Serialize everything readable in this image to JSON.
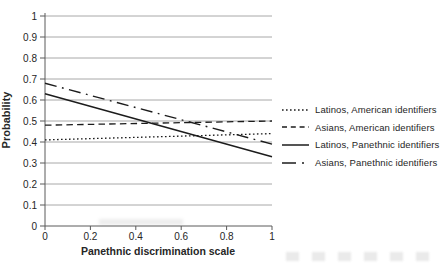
{
  "chart_data": {
    "type": "line",
    "title": "",
    "xlabel": "Panethnic discrimination scale",
    "ylabel": "Probability",
    "xlim": [
      0,
      1
    ],
    "ylim": [
      0,
      1
    ],
    "grid": "horizontal",
    "legend_position": "right",
    "x_ticks": [
      0,
      0.2,
      0.4,
      0.6,
      0.8,
      1
    ],
    "x_tick_labels": [
      "0",
      "0.2",
      "0.4",
      "0.6",
      "0.8",
      "1"
    ],
    "y_ticks": [
      0,
      0.1,
      0.2,
      0.3,
      0.4,
      0.5,
      0.6,
      0.7,
      0.8,
      0.9,
      1
    ],
    "y_tick_labels": [
      "0",
      "0.1",
      "0.2",
      "0.3",
      "0.4",
      "0.5",
      "0.6",
      "0.7",
      "0.8",
      "0.9",
      "1"
    ],
    "x": [
      0,
      1
    ],
    "series": [
      {
        "name": "Latinos, American identifiers",
        "style": "dotted",
        "values": [
          0.41,
          0.44
        ]
      },
      {
        "name": "Asians, American identifiers",
        "style": "dashed",
        "values": [
          0.48,
          0.5
        ]
      },
      {
        "name": "Latinos, Panethnic identifiers",
        "style": "solid",
        "values": [
          0.63,
          0.33
        ]
      },
      {
        "name": "Asians, Panethnic identifiers",
        "style": "dashdot",
        "values": [
          0.68,
          0.39
        ]
      }
    ],
    "colors": {
      "line": "#1c1c1c",
      "grid": "#a8a8a8",
      "axis": "#5a5a5a",
      "text": "#262626",
      "background": "#ffffff"
    }
  }
}
